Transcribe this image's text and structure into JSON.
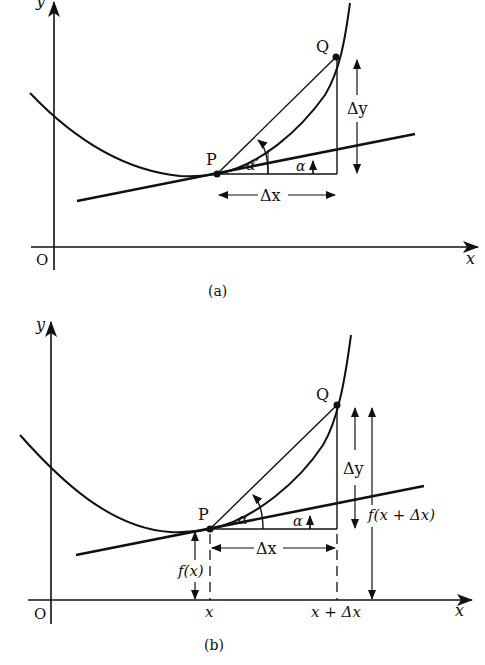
{
  "figure": {
    "panels": [
      {
        "id": "a",
        "caption": "(a)",
        "axis_x_label": "x",
        "axis_y_label": "y",
        "origin_label": "O",
        "point_p_label": "P",
        "point_q_label": "Q",
        "alpha_label": "α",
        "alpha_prime_label": "α′",
        "delta_x_label": "Δx",
        "delta_y_label": "Δy"
      },
      {
        "id": "b",
        "caption": "(b)",
        "axis_x_label": "x",
        "axis_y_label": "y",
        "origin_label": "O",
        "point_p_label": "P",
        "point_q_label": "Q",
        "alpha_label": "α",
        "alpha_prime_label": "α′",
        "delta_x_label": "Δx",
        "delta_y_label": "Δy",
        "fx_label": "f(x)",
        "fx_dx_label": "f(x + Δx)",
        "tick_x_label": "x",
        "tick_x_dx_label": "x + Δx"
      }
    ],
    "colors": {
      "ink": "#111111",
      "background": "#ffffff"
    }
  }
}
